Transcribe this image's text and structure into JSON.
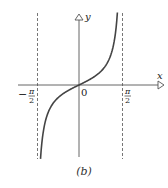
{
  "chart_data": {
    "type": "line",
    "title": "",
    "function": "y = tan(x)",
    "xlabel": "x",
    "ylabel": "y",
    "x_tick_labels": [
      "-π/2",
      "0",
      "π/2"
    ],
    "asymptotes": [
      "-π/2",
      "π/2"
    ],
    "series": [
      {
        "name": "tan x",
        "x": [
          -1.4,
          -1.2,
          -1.0,
          -0.8,
          -0.6,
          -0.4,
          -0.2,
          0,
          0.2,
          0.4,
          0.6,
          0.8,
          1.0,
          1.2,
          1.4
        ],
        "values": [
          -5.8,
          -2.57,
          -1.56,
          -1.03,
          -0.68,
          -0.42,
          -0.2,
          0,
          0.2,
          0.42,
          0.68,
          1.03,
          1.56,
          2.57,
          5.8
        ]
      }
    ],
    "grid": false,
    "legend": "none"
  },
  "labels": {
    "x_axis": "x",
    "y_axis": "y",
    "origin": "0",
    "neg_half_pi_sign": "−",
    "pi": "π",
    "two": "2",
    "caption": "(b)"
  },
  "colors": {
    "axis": "#555555",
    "curve": "#444444",
    "asymptote": "#555555"
  }
}
